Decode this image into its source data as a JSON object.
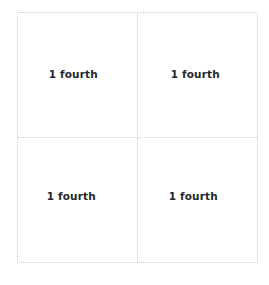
{
  "figure": {
    "shape": "square",
    "partitions": 4,
    "border_style": "dotted",
    "border_color": "#c9cbcd",
    "background_color": "#ffffff",
    "text_color": "#25282b"
  },
  "quadrants": [
    {
      "position": "top-left",
      "label": "1 fourth"
    },
    {
      "position": "top-right",
      "label": "1 fourth"
    },
    {
      "position": "bottom-left",
      "label": "1 fourth"
    },
    {
      "position": "bottom-right",
      "label": "1 fourth"
    }
  ]
}
